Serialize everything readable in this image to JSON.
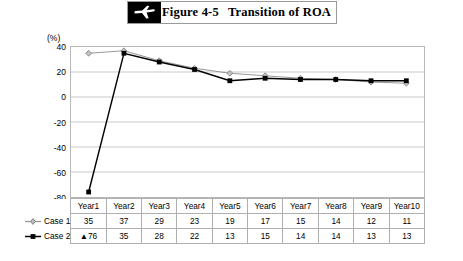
{
  "header": {
    "icon": "airplane-icon",
    "figure_number": "Figure 4-5",
    "title": "Transition of ROA"
  },
  "chart_data": {
    "type": "line",
    "title": "Transition of ROA",
    "unit_label": "(%)",
    "xlabel": "",
    "ylabel": "",
    "ylim": [
      -80,
      40
    ],
    "ytick_values": [
      40,
      20,
      0,
      -20,
      -40,
      -60,
      -80
    ],
    "ytick_labels": [
      "40",
      "20",
      "0",
      "-20",
      "-40",
      "-60",
      "-80"
    ],
    "grid": true,
    "legend_position": "table-left",
    "categories": [
      "Year1",
      "Year2",
      "Year3",
      "Year4",
      "Year5",
      "Year6",
      "Year7",
      "Year8",
      "Year9",
      "Year10"
    ],
    "series": [
      {
        "name": "Case 1",
        "marker": "diamond",
        "color": "#9a9a9a",
        "values": [
          35,
          37,
          29,
          23,
          19,
          17,
          15,
          14,
          12,
          11
        ],
        "display_values": [
          "35",
          "37",
          "29",
          "23",
          "19",
          "17",
          "15",
          "14",
          "12",
          "11"
        ]
      },
      {
        "name": "Case 2",
        "marker": "square",
        "color": "#000000",
        "values": [
          -76,
          35,
          28,
          22,
          13,
          15,
          14,
          14,
          13,
          13
        ],
        "display_values": [
          "▲76",
          "35",
          "28",
          "22",
          "13",
          "15",
          "14",
          "14",
          "13",
          "13"
        ]
      }
    ]
  },
  "table": {
    "header_row": [
      "Year1",
      "Year2",
      "Year3",
      "Year4",
      "Year5",
      "Year6",
      "Year7",
      "Year8",
      "Year9",
      "Year10"
    ],
    "rows": [
      {
        "label": "Case 1",
        "values": [
          "35",
          "37",
          "29",
          "23",
          "19",
          "17",
          "15",
          "14",
          "12",
          "11"
        ]
      },
      {
        "label": "Case 2",
        "values": [
          "▲76",
          "35",
          "28",
          "22",
          "13",
          "15",
          "14",
          "14",
          "13",
          "13"
        ]
      }
    ]
  },
  "colors": {
    "case1": "#9a9a9a",
    "case2": "#000000",
    "grid": "#c9c9c9",
    "border": "#b0b0b0",
    "banner": "#000000"
  }
}
